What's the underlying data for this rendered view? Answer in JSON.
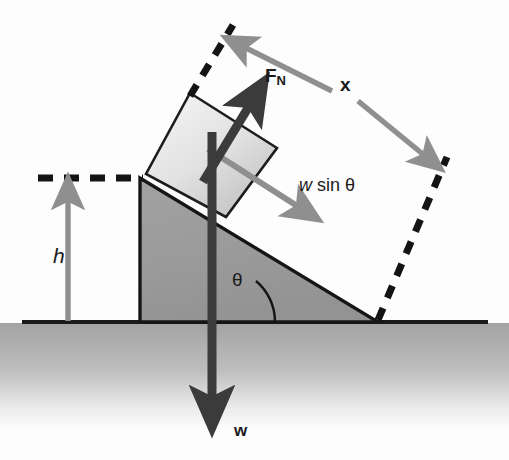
{
  "figure": {
    "type": "physics-free-body-diagram",
    "background_color": "#fdfdfd"
  },
  "labels": {
    "normal_force": {
      "text": "F",
      "subscript": "N",
      "full": "F_N",
      "meaning": "normal force"
    },
    "slide_distance": {
      "text": "x",
      "meaning": "distance travelled along incline"
    },
    "weight_component": {
      "text_italic": "w",
      "text_rest": " sin θ",
      "full": "w sin θ",
      "meaning": "component of weight parallel to incline"
    },
    "height": {
      "text": "h",
      "meaning": "vertical height of incline"
    },
    "angle": {
      "text": "θ",
      "meaning": "incline angle"
    },
    "weight": {
      "text": "w",
      "meaning": "weight of block"
    }
  },
  "colors": {
    "wedge_fill": "#9b9b9b",
    "wedge_stroke": "#161616",
    "block_fill_light": "#f2f2f2",
    "block_fill_dark": "#c8c8c8",
    "block_stroke": "#1d1d1d",
    "ground_line": "#1a1a1a",
    "ground_gradient_top": "#a6a6a6",
    "ground_gradient_bottom": "#ffffff",
    "gray_arrow": "#8f8f8f",
    "dark_arrow": "#3b3b3b",
    "dashed_line": "#141414",
    "text": "#1a1a1a"
  },
  "geometry": {
    "ground_line_y": 322,
    "incline_angle_degrees": 33,
    "wedge_vertices": [
      [
        140,
        322
      ],
      [
        140,
        178
      ],
      [
        378,
        322
      ]
    ],
    "block_vertices": [
      [
        190,
        93
      ],
      [
        276,
        148
      ],
      [
        226,
        216
      ],
      [
        147,
        174
      ]
    ],
    "dimension_h": {
      "from": [
        68,
        322
      ],
      "to": [
        68,
        184
      ]
    },
    "dimension_x": {
      "from": [
        232,
        40
      ],
      "to": [
        436,
        168
      ]
    }
  },
  "arrows": [
    {
      "name": "normal-force-arrow",
      "label": "F_N",
      "color": "#3b3b3b",
      "from": [
        205,
        178
      ],
      "to": [
        260,
        88
      ],
      "style": "solid-thick"
    },
    {
      "name": "weight-arrow",
      "label": "w",
      "color": "#3b3b3b",
      "from": [
        218,
        135
      ],
      "to": [
        218,
        420
      ],
      "style": "solid-thick"
    },
    {
      "name": "weight-component-arrow",
      "label": "w sin θ",
      "color": "#8f8f8f",
      "from": [
        213,
        150
      ],
      "to": [
        312,
        215
      ],
      "style": "solid-medium"
    },
    {
      "name": "height-arrow",
      "label": "h",
      "color": "#8f8f8f",
      "from": [
        68,
        322
      ],
      "to": [
        68,
        186
      ],
      "style": "solid-medium"
    },
    {
      "name": "x-dimension-arrow-upper",
      "label": "x",
      "color": "#8f8f8f",
      "from": [
        330,
        90
      ],
      "to": [
        232,
        42
      ],
      "style": "dimension"
    },
    {
      "name": "x-dimension-arrow-lower",
      "label": "x",
      "color": "#8f8f8f",
      "from": [
        356,
        100
      ],
      "to": [
        437,
        166
      ],
      "style": "dimension"
    }
  ],
  "dashed_lines": [
    {
      "name": "horizontal-height-reference",
      "from": [
        40,
        178
      ],
      "to": [
        142,
        178
      ]
    },
    {
      "name": "incline-top-extension",
      "from": [
        190,
        93
      ],
      "to": [
        232,
        26
      ]
    },
    {
      "name": "incline-bottom-extension",
      "from": [
        378,
        322
      ],
      "to": [
        446,
        158
      ]
    }
  ]
}
